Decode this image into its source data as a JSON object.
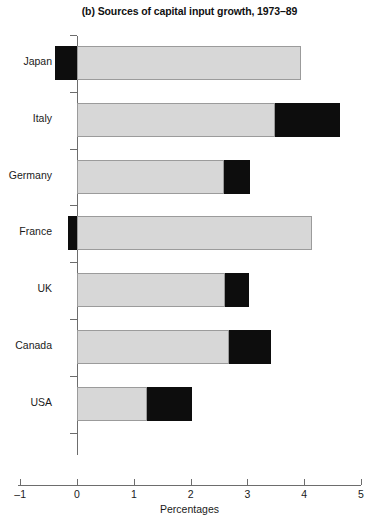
{
  "chart_data": {
    "type": "bar",
    "orientation": "horizontal",
    "stacked": true,
    "title": "(b) Sources of capital input growth, 1973–89",
    "xlabel": "Percentages",
    "ylabel": "",
    "xlim": [
      -1,
      5
    ],
    "xticks": [
      -1,
      0,
      1,
      2,
      3,
      4,
      5
    ],
    "xticklabels": [
      "–1",
      "0",
      "1",
      "2",
      "3",
      "4",
      "5"
    ],
    "grid": false,
    "legend": null,
    "categories": [
      "Japan",
      "Italy",
      "Germany",
      "France",
      "UK",
      "Canada",
      "USA"
    ],
    "series": [
      {
        "name": "light-segment",
        "color": "#d7d7d7",
        "values": [
          3.95,
          3.49,
          2.58,
          4.14,
          2.61,
          2.67,
          1.23
        ]
      },
      {
        "name": "dark-segment",
        "color": "#0d0d0d",
        "values": [
          -0.39,
          1.14,
          0.46,
          -0.16,
          0.42,
          0.75,
          0.79
        ]
      }
    ],
    "bars": [
      {
        "category": "Japan",
        "segments": [
          {
            "fill": "dark",
            "start": -0.39,
            "end": 0.0
          },
          {
            "fill": "light",
            "start": 0.0,
            "end": 3.95
          }
        ]
      },
      {
        "category": "Italy",
        "segments": [
          {
            "fill": "light",
            "start": 0.0,
            "end": 3.49
          },
          {
            "fill": "dark",
            "start": 3.49,
            "end": 4.63
          }
        ]
      },
      {
        "category": "Germany",
        "segments": [
          {
            "fill": "light",
            "start": 0.0,
            "end": 2.58
          },
          {
            "fill": "dark",
            "start": 2.58,
            "end": 3.04
          }
        ]
      },
      {
        "category": "France",
        "segments": [
          {
            "fill": "dark",
            "start": -0.16,
            "end": 0.0
          },
          {
            "fill": "light",
            "start": 0.0,
            "end": 4.14
          }
        ]
      },
      {
        "category": "UK",
        "segments": [
          {
            "fill": "light",
            "start": 0.0,
            "end": 2.61
          },
          {
            "fill": "dark",
            "start": 2.61,
            "end": 3.03
          }
        ]
      },
      {
        "category": "Canada",
        "segments": [
          {
            "fill": "light",
            "start": 0.0,
            "end": 2.67
          },
          {
            "fill": "dark",
            "start": 2.67,
            "end": 3.42
          }
        ]
      },
      {
        "category": "USA",
        "segments": [
          {
            "fill": "light",
            "start": 0.0,
            "end": 1.23
          },
          {
            "fill": "dark",
            "start": 1.23,
            "end": 2.02
          }
        ]
      }
    ]
  },
  "colors": {
    "light_fill": "#d7d7d7",
    "light_border": "#9b9b9b",
    "dark_fill": "#0d0d0d",
    "axis": "#6d6d6d",
    "text": "#1a1a1a",
    "background": "#ffffff"
  }
}
